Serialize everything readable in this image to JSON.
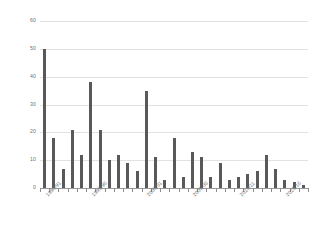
{
  "chart_data": {
    "type": "bar",
    "title": "",
    "xlabel": "",
    "ylabel": "Numbers of birds",
    "ylim": [
      0,
      60
    ],
    "yticks": [
      0,
      10,
      20,
      30,
      40,
      50,
      60
    ],
    "grid": true,
    "legend": "none",
    "bar_color": "#595959",
    "grid_color": "#e2e2e2",
    "categories": [
      "1990/91",
      "1991/92",
      "1992/93",
      "1993/94",
      "1994/95",
      "1995/96",
      "1996/97",
      "1997/98",
      "1998/99",
      "1999/00",
      "2000/01",
      "2001/02",
      "2002/03",
      "2003/04",
      "2004/05",
      "2005/06",
      "2006/07",
      "2007/08",
      "2008/09",
      "2009/10",
      "2010/11",
      "2011/12",
      "2012/13",
      "2013/14",
      "2014/15",
      "2015/16",
      "2016/17",
      "2017/18",
      "2018/19"
    ],
    "values": [
      50,
      18,
      7,
      21,
      12,
      38,
      21,
      10,
      12,
      9,
      6,
      35,
      11,
      3,
      18,
      4,
      13,
      11,
      4,
      9,
      3,
      4,
      5,
      6,
      12,
      7,
      3,
      2,
      1
    ],
    "tick_labels_shown": [
      "1990/91",
      "1995/96",
      "2000/01",
      "2005/06",
      "2010/11",
      "2015/16"
    ],
    "tick_label_indices": [
      0,
      5,
      11,
      16,
      21,
      26
    ]
  }
}
